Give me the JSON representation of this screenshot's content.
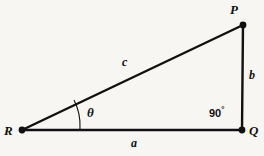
{
  "diagram": {
    "kind": "right-triangle-geometry",
    "background_color": "#f7f6f3",
    "stroke_color": "#111111",
    "vertices": [
      {
        "id": "P",
        "label": "P",
        "x": 243,
        "y": 25
      },
      {
        "id": "Q",
        "label": "Q",
        "x": 242,
        "y": 130
      },
      {
        "id": "R",
        "label": "R",
        "x": 22,
        "y": 130
      }
    ],
    "sides": [
      {
        "id": "a",
        "label": "a",
        "from": "R",
        "to": "Q",
        "position": "below-base"
      },
      {
        "id": "b",
        "label": "b",
        "from": "P",
        "to": "Q",
        "position": "right-of-vertical"
      },
      {
        "id": "c",
        "label": "c",
        "from": "R",
        "to": "P",
        "position": "above-hypotenuse"
      }
    ],
    "angles": [
      {
        "id": "theta",
        "label": "θ",
        "at_vertex": "R",
        "marker": "arc"
      },
      {
        "id": "right-angle",
        "value": "90",
        "unit": "°",
        "at_vertex": "Q",
        "marker": "none"
      }
    ]
  }
}
